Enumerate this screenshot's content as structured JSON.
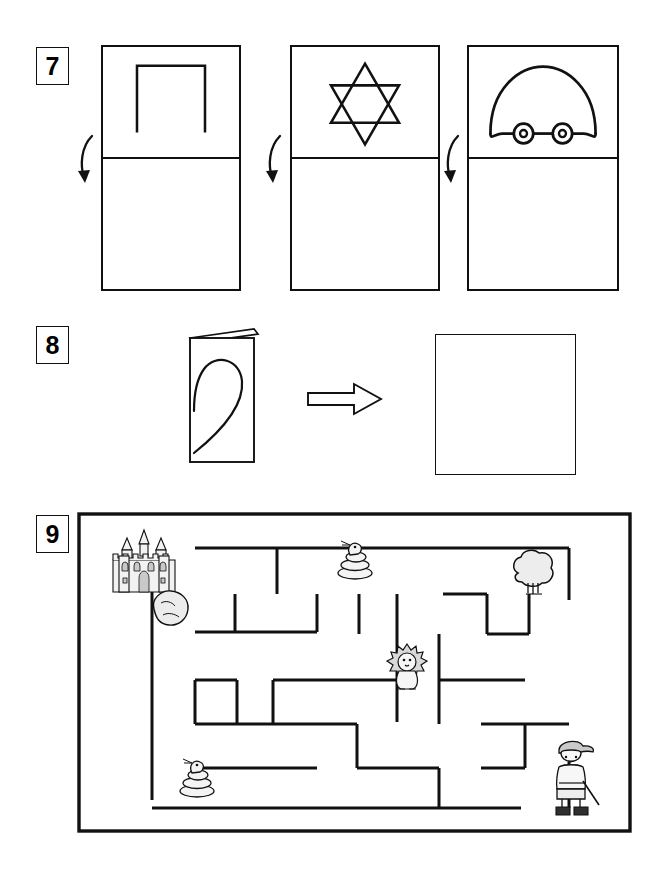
{
  "worksheet": {
    "title": "Symmetry and Maze Activity Worksheet",
    "exercises": [
      {
        "number": "7",
        "type": "fold-symmetry",
        "instruction_implied": "Draw the mirror image below the fold line",
        "panels": [
          {
            "shape_name": "open-square-arch",
            "position": "left",
            "folded_half": "bottom",
            "arrow": "fold-down-arrow"
          },
          {
            "shape_name": "six-pointed-star",
            "position": "middle",
            "folded_half": "bottom",
            "arrow": "fold-down-arrow"
          },
          {
            "shape_name": "dome-car",
            "position": "right",
            "folded_half": "bottom",
            "arrow": "fold-down-arrow"
          }
        ]
      },
      {
        "number": "8",
        "type": "unfold-prediction",
        "instruction_implied": "Draw what the card looks like when unfolded",
        "card": {
          "shape_name": "half-heart",
          "state": "folded-card"
        },
        "arrow": {
          "icon": "right-arrow-outline",
          "direction": "right"
        },
        "answer": {
          "state": "empty",
          "shape_name": "answer-square"
        }
      },
      {
        "number": "9",
        "type": "maze",
        "instruction_implied": "Help the explorer find the way to the castle",
        "start": {
          "name": "boy-explorer",
          "position": "bottom-right"
        },
        "goal": {
          "name": "castle",
          "position": "top-left"
        },
        "obstacles": [
          {
            "name": "rock",
            "position": "upper-left"
          },
          {
            "name": "snake",
            "position": "top-center"
          },
          {
            "name": "tree",
            "position": "top-right"
          },
          {
            "name": "lion",
            "position": "center"
          },
          {
            "name": "snake",
            "position": "bottom-left"
          }
        ]
      }
    ]
  },
  "colors": {
    "ink": "#111111",
    "paper": "#ffffff",
    "sprite_fill": "#f2f2f2",
    "sprite_shade": "#c9c9c9"
  }
}
